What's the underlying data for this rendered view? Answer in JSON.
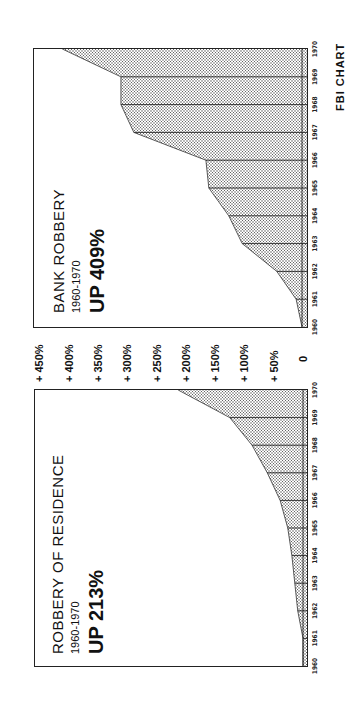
{
  "page": {
    "credit": "FBI CHART"
  },
  "axis": {
    "ticks": [
      {
        "label": "+ 450%",
        "value": 450
      },
      {
        "label": "+ 400%",
        "value": 400
      },
      {
        "label": "+ 350%",
        "value": 350
      },
      {
        "label": "+ 300%",
        "value": 300
      },
      {
        "label": "+ 250%",
        "value": 250
      },
      {
        "label": "+ 200%",
        "value": 200
      },
      {
        "label": "+ 150%",
        "value": 150
      },
      {
        "label": "+ 100%",
        "value": 100
      },
      {
        "label": "+ 50%",
        "value": 50
      },
      {
        "label": "0",
        "value": 0
      }
    ]
  },
  "panels": {
    "residence": {
      "title": "ROBBERY OF RESIDENCE",
      "subtitle": "1960-1970",
      "headline": "UP 213%"
    },
    "bank": {
      "title": "BANK ROBBERY",
      "subtitle": "1960-1970",
      "headline": "UP 409%"
    }
  },
  "colors": {
    "ink": "#111111",
    "fill_dot": "#555555",
    "background": "#ffffff"
  },
  "chart_data": [
    {
      "type": "area",
      "title": "ROBBERY OF RESIDENCE",
      "subtitle": "1960-1970",
      "annotation": "UP 213%",
      "categories": [
        "1960",
        "1961",
        "1962",
        "1963",
        "1964",
        "1965",
        "1966",
        "1967",
        "1968",
        "1969",
        "1970"
      ],
      "values": [
        0,
        0,
        9,
        14,
        19,
        26,
        39,
        61,
        87,
        125,
        213
      ],
      "xlabel": "",
      "ylabel": "Percent increase since 1960",
      "ylim": [
        0,
        450
      ],
      "y_ticks": [
        "0",
        "+ 50%",
        "+ 100%",
        "+ 150%",
        "+ 200%",
        "+ 250%",
        "+ 300%",
        "+ 350%",
        "+ 400%",
        "+ 450%"
      ],
      "grid": "vertical lines at each year",
      "fill": "dotted stipple",
      "orientation": "rotated 90° counter-clockwise on page"
    },
    {
      "type": "area",
      "title": "BANK ROBBERY",
      "subtitle": "1960-1970",
      "annotation": "UP 409%",
      "categories": [
        "1960",
        "1961",
        "1962",
        "1963",
        "1964",
        "1965",
        "1966",
        "1967",
        "1968",
        "1969",
        "1970"
      ],
      "values": [
        0,
        10,
        43,
        102,
        125,
        159,
        164,
        287,
        309,
        309,
        409
      ],
      "xlabel": "",
      "ylabel": "Percent increase since 1960",
      "ylim": [
        0,
        450
      ],
      "y_ticks": [
        "0",
        "+ 50%",
        "+ 100%",
        "+ 150%",
        "+ 200%",
        "+ 250%",
        "+ 300%",
        "+ 350%",
        "+ 400%",
        "+ 450%"
      ],
      "grid": "vertical lines at each year",
      "fill": "dotted stipple",
      "source": "FBI CHART",
      "orientation": "rotated 90° counter-clockwise on page"
    }
  ]
}
